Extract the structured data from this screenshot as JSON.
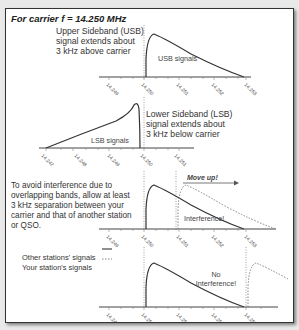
{
  "title": "For carrier f = 14.250 MHz",
  "usb": {
    "description": [
      "Upper Sideband (USB)",
      "signal extends about",
      "3 kHz above carrier"
    ],
    "signal_label": "USB signals",
    "ticks": [
      "14.249",
      "14.250",
      "14.251",
      "14.252",
      "14.253"
    ]
  },
  "lsb": {
    "description": [
      "Lower Sideband (LSB)",
      "signal extends about",
      "3 kHz below carrier"
    ],
    "signal_label": "LSB signals",
    "ticks": [
      "14.247",
      "14.248",
      "14.249",
      "14.250",
      "14.251"
    ]
  },
  "interference": {
    "description": [
      "To avoid interference due to",
      "overlapping bands, allow at least",
      "3 kHz separation between your",
      "carrier and that of another station",
      "or QSO."
    ],
    "move_label": "Move up!",
    "interference_label": "Interference!",
    "ticks": [
      "14.249",
      "14.250",
      "14.251",
      "14.252",
      "14.253"
    ]
  },
  "legend": {
    "other": "Other stations' signals",
    "yours": "Your station's signals"
  },
  "no_interference": {
    "label_line1": "No",
    "label_line2": "Interference!",
    "ticks": [
      "14.249",
      "14.250",
      "14.251",
      "14.252",
      "14.253"
    ]
  },
  "colors": {
    "signal": "#333333",
    "dotted": "#777777",
    "axis": "#444444"
  }
}
